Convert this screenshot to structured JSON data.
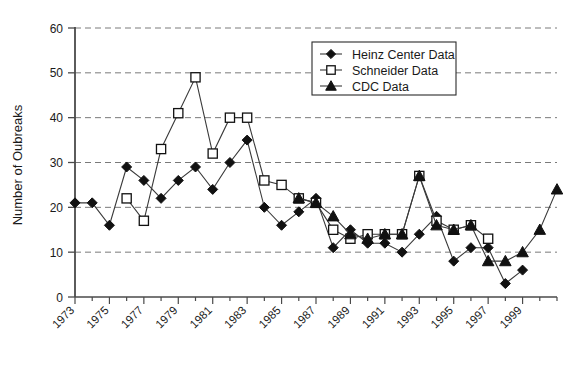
{
  "chart_data": {
    "type": "line",
    "title": "",
    "xlabel": "",
    "ylabel": "Number of Oubreaks",
    "ylim": [
      0,
      60
    ],
    "yticks": [
      0,
      10,
      20,
      30,
      40,
      50,
      60
    ],
    "xlim": [
      1973,
      2001
    ],
    "xticks": [
      1973,
      1975,
      1977,
      1979,
      1981,
      1983,
      1985,
      1987,
      1989,
      1991,
      1993,
      1995,
      1997,
      1999
    ],
    "xtick_labels": [
      "1973",
      "1975",
      "1977",
      "1979",
      "1981",
      "1983",
      "1985",
      "1987",
      "1989",
      "1991",
      "1993",
      "1995",
      "1997",
      "1999"
    ],
    "grid": "horizontal-dashed",
    "legend_position": "top-right",
    "series": [
      {
        "name": "Heinz Center Data",
        "marker": "filled-diamond",
        "color": "#111111",
        "x": [
          1973,
          1974,
          1975,
          1976,
          1977,
          1978,
          1979,
          1980,
          1981,
          1982,
          1983,
          1984,
          1985,
          1986,
          1987,
          1988,
          1989,
          1990,
          1991,
          1992,
          1993,
          1994,
          1995,
          1996,
          1997,
          1998,
          1999
        ],
        "values": [
          21,
          21,
          16,
          29,
          26,
          22,
          26,
          29,
          24,
          30,
          35,
          20,
          16,
          19,
          22,
          11,
          15,
          12,
          12,
          10,
          14,
          18,
          8,
          11,
          11,
          3,
          6
        ]
      },
      {
        "name": "Schneider Data",
        "marker": "open-square",
        "color": "#111111",
        "x": [
          1976,
          1977,
          1978,
          1979,
          1980,
          1981,
          1982,
          1983,
          1984,
          1985,
          1986,
          1987,
          1988,
          1989,
          1990,
          1991,
          1992,
          1993,
          1994,
          1995,
          1996,
          1997
        ],
        "values": [
          22,
          17,
          33,
          41,
          49,
          32,
          40,
          40,
          26,
          25,
          22,
          21,
          15,
          13,
          14,
          14,
          14,
          27,
          17,
          15,
          16,
          13
        ]
      },
      {
        "name": "CDC Data",
        "marker": "filled-triangle",
        "color": "#111111",
        "x": [
          1986,
          1987,
          1988,
          1989,
          1990,
          1991,
          1992,
          1993,
          1994,
          1995,
          1996,
          1997,
          1998,
          1999,
          2000,
          2001
        ],
        "values": [
          22,
          21,
          18,
          14,
          13,
          14,
          14,
          27,
          16,
          15,
          16,
          8,
          8,
          10,
          15,
          24
        ]
      }
    ]
  },
  "legend": {
    "entries": [
      {
        "label": "Heinz Center Data",
        "marker": "filled-diamond"
      },
      {
        "label": "Schneider Data",
        "marker": "open-square"
      },
      {
        "label": "CDC Data",
        "marker": "filled-triangle"
      }
    ]
  },
  "axes": {
    "y_label": "Number of Oubreaks",
    "y_tick_0": "0",
    "y_tick_10": "10",
    "y_tick_20": "20",
    "y_tick_30": "30",
    "y_tick_40": "40",
    "y_tick_50": "50",
    "y_tick_60": "60"
  },
  "colors": {
    "line": "#3a3a3a",
    "marker": "#111111",
    "grid": "#7a7a7a",
    "axis": "#4a4a4a",
    "background": "#ffffff"
  }
}
